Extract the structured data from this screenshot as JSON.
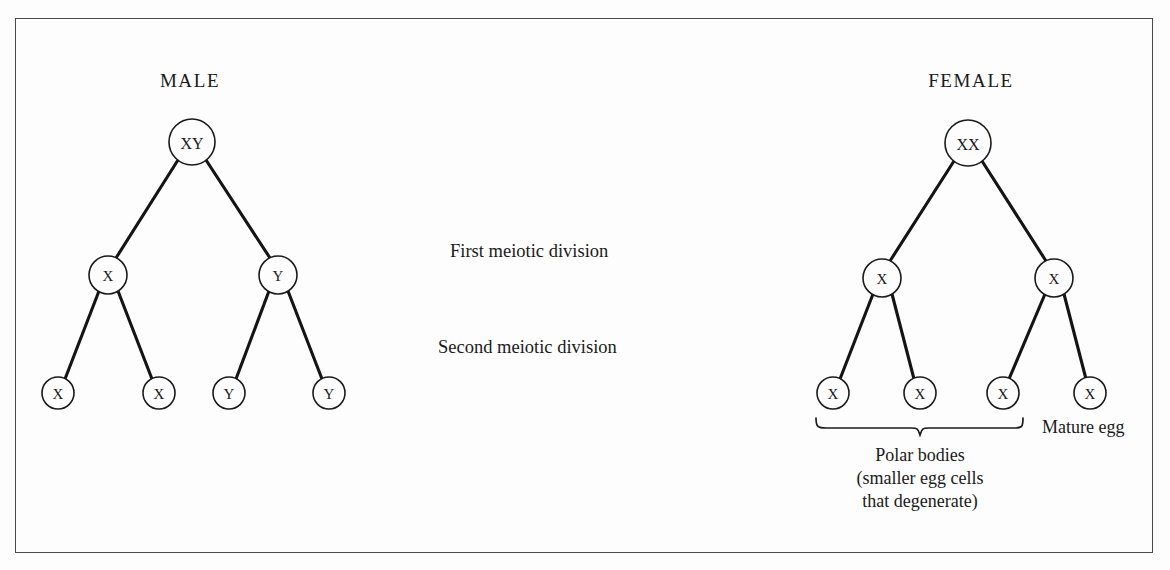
{
  "figure": {
    "background_color": "#fdfdfd",
    "frame_color": "#4a4a4a",
    "ink_color": "#1a1a1a"
  },
  "panels": {
    "male": {
      "title": "MALE",
      "root": {
        "label": "XY"
      },
      "tier2": [
        {
          "label": "X"
        },
        {
          "label": "Y"
        }
      ],
      "tier3": [
        {
          "label": "X"
        },
        {
          "label": "X"
        },
        {
          "label": "Y"
        },
        {
          "label": "Y"
        }
      ]
    },
    "female": {
      "title": "FEMALE",
      "root": {
        "label": "XX"
      },
      "tier2": [
        {
          "label": "X"
        },
        {
          "label": "X"
        }
      ],
      "tier3": [
        {
          "label": "X"
        },
        {
          "label": "X"
        },
        {
          "label": "X"
        },
        {
          "label": "X"
        }
      ],
      "annotations": {
        "polar_bodies_line1": "Polar bodies",
        "polar_bodies_line2": "(smaller egg cells",
        "polar_bodies_line3": "that degenerate)",
        "mature_egg": "Mature egg"
      }
    }
  },
  "stage_labels": {
    "first": "First meiotic  division",
    "second": "Second meiotic  division"
  }
}
